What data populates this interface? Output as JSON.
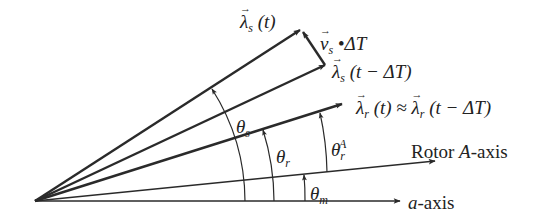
{
  "diagram": {
    "labels": {
      "lambda_s_t": {
        "symbol": "λ",
        "sub": "s",
        "arg": " (t)"
      },
      "vs_dt": {
        "symbol": "v",
        "sub": "s",
        "rest": " •ΔT"
      },
      "lambda_s_t_dt": {
        "symbol": "λ",
        "sub": "s",
        "arg": " (t − ΔT)"
      },
      "lambda_r": {
        "symbol": "λ",
        "sub": "r",
        "arg": " (t) ≈ ",
        "symbol2": "λ",
        "sub2": "r",
        "arg2": " (t − ΔT)"
      },
      "theta_s": {
        "symbol": "θ",
        "sub": "s"
      },
      "theta_r": {
        "symbol": "θ",
        "sub": "r"
      },
      "theta_rA": {
        "symbol": "θ",
        "sub": "r",
        "sup": "A"
      },
      "theta_m": {
        "symbol": "θ",
        "sub": "m"
      },
      "rotor_axis": {
        "prefix": "Rotor ",
        "italic": "A",
        "suffix": "-axis"
      },
      "a_axis": {
        "italic": "a",
        "suffix": "-axis"
      }
    },
    "colors": {
      "line": "#2a2a2a",
      "background": "#ffffff"
    }
  }
}
